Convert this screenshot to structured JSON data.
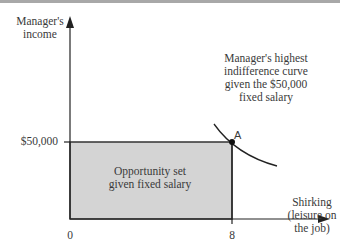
{
  "diagram": {
    "y_axis_label_line1": "Manager's",
    "y_axis_label_line2": "income",
    "x_axis_label_line1": "Shirking",
    "x_axis_label_line2": "(leisure on",
    "x_axis_label_line3": "the job)",
    "y_tick_label": "$50,000",
    "x_tick_origin": "0",
    "x_tick_label": "8",
    "curve_annotation_line1": "Manager's highest",
    "curve_annotation_line2": "indifference curve",
    "curve_annotation_line3": "given the $50,000",
    "curve_annotation_line4": "fixed salary",
    "region_label_line1": "Opportunity set",
    "region_label_line2": "given fixed salary",
    "point_label": "A",
    "colors": {
      "region_fill": "#d4d4d4",
      "line": "#222222",
      "text": "#3a3a3a"
    }
  }
}
